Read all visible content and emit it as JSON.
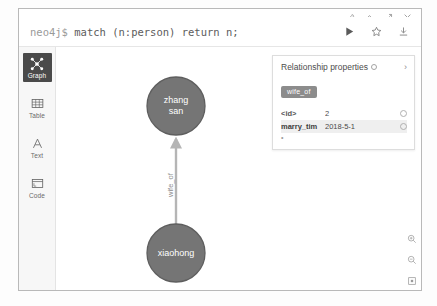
{
  "window": {
    "controls": [
      {
        "name": "pin-icon",
        "glyph": "pin"
      },
      {
        "name": "collapse-icon",
        "glyph": "chevron-up"
      },
      {
        "name": "expand-icon",
        "glyph": "expand"
      },
      {
        "name": "close-icon",
        "glyph": "close"
      }
    ]
  },
  "editor": {
    "prompt": "neo4j$",
    "query": "match (n:person) return n;",
    "actions": [
      {
        "name": "run-query-button",
        "label": "Run"
      },
      {
        "name": "favorite-button",
        "label": "Favorite"
      },
      {
        "name": "download-button",
        "label": "Download"
      }
    ]
  },
  "sidebar": {
    "items": [
      {
        "label": "Graph",
        "icon": "graph-icon",
        "active": true
      },
      {
        "label": "Table",
        "icon": "table-icon",
        "active": false
      },
      {
        "label": "Text",
        "icon": "text-icon",
        "active": false
      },
      {
        "label": "Code",
        "icon": "code-icon",
        "active": false
      }
    ]
  },
  "graph": {
    "nodes": [
      {
        "id": "zhangsan",
        "lines": [
          "zhang",
          "san"
        ],
        "cx": 120,
        "cy": 59,
        "r": 29
      },
      {
        "id": "xiaohong",
        "lines": [
          "xiaohong"
        ],
        "cx": 120,
        "cy": 206,
        "r": 29
      }
    ],
    "relationship": {
      "label": "wife_of",
      "from": "xiaohong",
      "to": "zhangsan"
    },
    "colors": {
      "node_fill": "#757575",
      "node_stroke": "#5e5e5e",
      "node_text": "#ffffff",
      "edge": "#b5b5b5"
    },
    "zoom_controls": [
      {
        "name": "zoom-in-button",
        "label": "Zoom in"
      },
      {
        "name": "zoom-out-button",
        "label": "Zoom out"
      },
      {
        "name": "zoom-fit-button",
        "label": "Fit to screen"
      }
    ]
  },
  "properties_panel": {
    "title": "Relationship properties",
    "chevron": "›",
    "badge": "wife_of",
    "rows": [
      {
        "key": "<id>",
        "value": "2",
        "highlight": false
      },
      {
        "key": "marry_tim",
        "value": "2018-5-1",
        "highlight": true
      }
    ],
    "more": "•"
  }
}
